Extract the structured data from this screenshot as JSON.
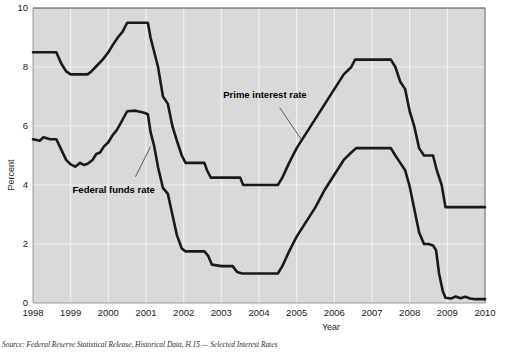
{
  "chart_data": {
    "type": "line",
    "title": "",
    "xlabel": "Year",
    "ylabel": "Percent",
    "xlim": [
      1998,
      2010
    ],
    "ylim": [
      0,
      10
    ],
    "xticks": [
      "1998",
      "1999",
      "2000",
      "2001",
      "2002",
      "2003",
      "2004",
      "2005",
      "2006",
      "2007",
      "2008",
      "2009",
      "2010"
    ],
    "yticks": [
      "0",
      "2",
      "4",
      "6",
      "8",
      "10"
    ],
    "grid": true,
    "legend": "inline-annotations",
    "series": [
      {
        "name": "Prime interest rate",
        "color": "#1a1a1a",
        "label_x": 2003.05,
        "label_y": 6.95,
        "leader": [
          [
            2004.55,
            6.62
          ],
          [
            2005.12,
            5.55
          ]
        ],
        "points": [
          [
            1998.0,
            8.5
          ],
          [
            1998.62,
            8.5
          ],
          [
            1998.75,
            8.12
          ],
          [
            1998.88,
            7.85
          ],
          [
            1999.0,
            7.75
          ],
          [
            1999.45,
            7.75
          ],
          [
            1999.55,
            7.85
          ],
          [
            1999.7,
            8.05
          ],
          [
            1999.85,
            8.25
          ],
          [
            2000.0,
            8.5
          ],
          [
            2000.12,
            8.75
          ],
          [
            2000.25,
            9.0
          ],
          [
            2000.38,
            9.2
          ],
          [
            2000.5,
            9.5
          ],
          [
            2000.95,
            9.5
          ],
          [
            2001.05,
            9.5
          ],
          [
            2001.12,
            9.0
          ],
          [
            2001.22,
            8.5
          ],
          [
            2001.32,
            8.0
          ],
          [
            2001.45,
            7.0
          ],
          [
            2001.58,
            6.75
          ],
          [
            2001.7,
            6.0
          ],
          [
            2001.82,
            5.5
          ],
          [
            2001.95,
            5.0
          ],
          [
            2002.05,
            4.75
          ],
          [
            2002.55,
            4.75
          ],
          [
            2002.62,
            4.5
          ],
          [
            2002.72,
            4.25
          ],
          [
            2003.0,
            4.25
          ],
          [
            2003.5,
            4.25
          ],
          [
            2003.58,
            4.0
          ],
          [
            2004.0,
            4.0
          ],
          [
            2004.5,
            4.0
          ],
          [
            2004.62,
            4.25
          ],
          [
            2004.8,
            4.75
          ],
          [
            2005.0,
            5.25
          ],
          [
            2005.25,
            5.75
          ],
          [
            2005.5,
            6.25
          ],
          [
            2005.75,
            6.75
          ],
          [
            2006.0,
            7.25
          ],
          [
            2006.25,
            7.75
          ],
          [
            2006.45,
            8.0
          ],
          [
            2006.55,
            8.25
          ],
          [
            2007.5,
            8.25
          ],
          [
            2007.62,
            8.0
          ],
          [
            2007.75,
            7.5
          ],
          [
            2007.88,
            7.25
          ],
          [
            2008.0,
            6.5
          ],
          [
            2008.12,
            6.0
          ],
          [
            2008.25,
            5.25
          ],
          [
            2008.38,
            5.0
          ],
          [
            2008.5,
            5.0
          ],
          [
            2008.62,
            5.0
          ],
          [
            2008.72,
            4.5
          ],
          [
            2008.85,
            4.0
          ],
          [
            2008.95,
            3.25
          ],
          [
            2009.05,
            3.25
          ],
          [
            2010.0,
            3.25
          ]
        ]
      },
      {
        "name": "Federal funds rate",
        "color": "#1a1a1a",
        "label_x": 1999.05,
        "label_y": 3.72,
        "leader": [
          [
            2000.72,
            4.28
          ],
          [
            2001.12,
            5.3
          ]
        ],
        "points": [
          [
            1998.0,
            5.55
          ],
          [
            1998.18,
            5.5
          ],
          [
            1998.28,
            5.62
          ],
          [
            1998.45,
            5.55
          ],
          [
            1998.62,
            5.55
          ],
          [
            1998.75,
            5.2
          ],
          [
            1998.88,
            4.85
          ],
          [
            1999.0,
            4.7
          ],
          [
            1999.12,
            4.62
          ],
          [
            1999.25,
            4.75
          ],
          [
            1999.35,
            4.68
          ],
          [
            1999.45,
            4.72
          ],
          [
            1999.58,
            4.85
          ],
          [
            1999.68,
            5.05
          ],
          [
            1999.78,
            5.1
          ],
          [
            1999.88,
            5.3
          ],
          [
            2000.0,
            5.45
          ],
          [
            2000.12,
            5.7
          ],
          [
            2000.22,
            5.85
          ],
          [
            2000.35,
            6.15
          ],
          [
            2000.5,
            6.5
          ],
          [
            2000.72,
            6.52
          ],
          [
            2000.95,
            6.45
          ],
          [
            2001.05,
            6.4
          ],
          [
            2001.12,
            5.8
          ],
          [
            2001.22,
            5.3
          ],
          [
            2001.32,
            4.6
          ],
          [
            2001.45,
            3.9
          ],
          [
            2001.58,
            3.7
          ],
          [
            2001.7,
            3.0
          ],
          [
            2001.82,
            2.3
          ],
          [
            2001.95,
            1.85
          ],
          [
            2002.05,
            1.75
          ],
          [
            2002.55,
            1.75
          ],
          [
            2002.65,
            1.6
          ],
          [
            2002.75,
            1.3
          ],
          [
            2003.0,
            1.25
          ],
          [
            2003.3,
            1.25
          ],
          [
            2003.42,
            1.05
          ],
          [
            2003.55,
            1.0
          ],
          [
            2004.0,
            1.0
          ],
          [
            2004.5,
            1.0
          ],
          [
            2004.62,
            1.25
          ],
          [
            2004.8,
            1.75
          ],
          [
            2005.0,
            2.25
          ],
          [
            2005.25,
            2.75
          ],
          [
            2005.5,
            3.25
          ],
          [
            2005.75,
            3.85
          ],
          [
            2006.0,
            4.35
          ],
          [
            2006.25,
            4.85
          ],
          [
            2006.45,
            5.1
          ],
          [
            2006.58,
            5.25
          ],
          [
            2007.5,
            5.25
          ],
          [
            2007.62,
            5.0
          ],
          [
            2007.75,
            4.75
          ],
          [
            2007.88,
            4.5
          ],
          [
            2008.0,
            3.95
          ],
          [
            2008.12,
            3.2
          ],
          [
            2008.25,
            2.4
          ],
          [
            2008.38,
            2.0
          ],
          [
            2008.5,
            2.0
          ],
          [
            2008.62,
            1.95
          ],
          [
            2008.7,
            1.8
          ],
          [
            2008.78,
            1.0
          ],
          [
            2008.88,
            0.4
          ],
          [
            2008.95,
            0.18
          ],
          [
            2009.1,
            0.15
          ],
          [
            2009.22,
            0.22
          ],
          [
            2009.35,
            0.16
          ],
          [
            2009.48,
            0.21
          ],
          [
            2009.6,
            0.15
          ],
          [
            2009.75,
            0.13
          ],
          [
            2010.0,
            0.13
          ]
        ]
      }
    ]
  },
  "source": {
    "text": "Source: Federal Reserve Statistical Release, Historical Data, H.15 — Selected Interest Rates"
  },
  "colors": {
    "plot_background": "#d9d9d9",
    "gridline": "#f0f0f0",
    "line": "#1a1a1a",
    "frame": "#555555"
  }
}
